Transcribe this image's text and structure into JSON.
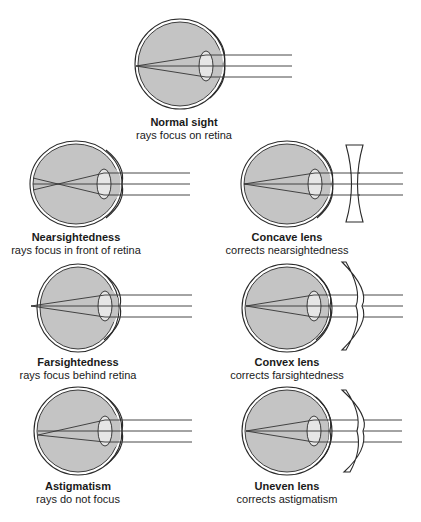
{
  "panels": {
    "normal": {
      "title": "Normal sight",
      "subtitle": "rays focus on retina"
    },
    "nearsighted": {
      "title": "Nearsightedness",
      "subtitle": "rays focus in front of retina"
    },
    "concave": {
      "title": "Concave lens",
      "subtitle": "corrects nearsightedness"
    },
    "farsighted": {
      "title": "Farsightedness",
      "subtitle": "rays focus behind retina"
    },
    "convex": {
      "title": "Convex lens",
      "subtitle": "corrects farsightedness"
    },
    "astigmatism": {
      "title": "Astigmatism",
      "subtitle": "rays do not focus"
    },
    "uneven": {
      "title": "Uneven lens",
      "subtitle": "corrects astigmatism"
    }
  },
  "colors": {
    "eye_fill": "#c4c4c4",
    "lens_fill": "#e6e6e6",
    "outline": "#2a2a2a"
  }
}
